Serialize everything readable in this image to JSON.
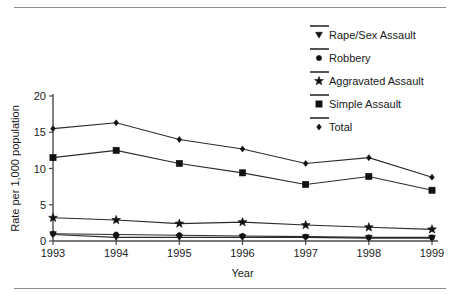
{
  "chart_data": {
    "type": "line",
    "title": "",
    "xlabel": "Year",
    "ylabel": "Rate per 1,000 population",
    "categories": [
      "1993",
      "1994",
      "1995",
      "1996",
      "1997",
      "1998",
      "1999"
    ],
    "x": [
      1993,
      1994,
      1995,
      1996,
      1997,
      1998,
      1999
    ],
    "xlim": [
      1993,
      1999
    ],
    "ylim": [
      0,
      20
    ],
    "yticks": [
      0,
      5,
      10,
      15,
      20
    ],
    "ytick_labels": [
      "0",
      "5",
      "10",
      "15",
      "20"
    ],
    "grid": false,
    "legend_position": "top-right",
    "series": [
      {
        "name": "Rape/Sex Assault",
        "marker": "triangle-down",
        "values": [
          0.9,
          0.5,
          0.5,
          0.5,
          0.5,
          0.4,
          0.4
        ]
      },
      {
        "name": "Robbery",
        "marker": "circle",
        "values": [
          1.0,
          0.9,
          0.8,
          0.7,
          0.6,
          0.5,
          0.5
        ]
      },
      {
        "name": "Aggravated Assault",
        "marker": "star",
        "values": [
          3.2,
          2.9,
          2.4,
          2.6,
          2.2,
          1.9,
          1.6
        ]
      },
      {
        "name": "Simple Assault",
        "marker": "square",
        "values": [
          11.5,
          12.5,
          10.7,
          9.4,
          7.8,
          8.9,
          7.0
        ]
      },
      {
        "name": "Total",
        "marker": "diamond",
        "values": [
          15.5,
          16.3,
          14.0,
          12.7,
          10.7,
          11.5,
          8.8
        ]
      }
    ],
    "colors": {
      "line": "#2b2b2b",
      "marker": "#111111",
      "axis": "#4a4a4a",
      "text": "#1a1a1a",
      "rule": "#8d8d8d",
      "background": "#ffffff"
    }
  }
}
